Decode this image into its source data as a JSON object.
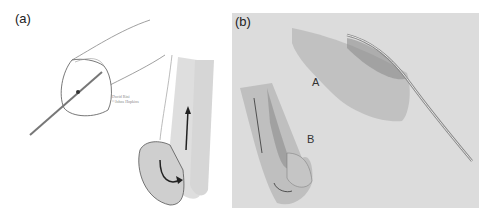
{
  "figure": {
    "panels": [
      {
        "id": "a",
        "label": "(a)",
        "credit_line_1": "David Rini",
        "credit_line_2": "©Johns Hopkins"
      },
      {
        "id": "b",
        "label": "(b)",
        "annotations": [
          "A",
          "B"
        ]
      }
    ],
    "colors": {
      "background": "#ffffff",
      "panel_b_background": "#dcdcdc",
      "line": "#555555",
      "stipple": "#9a9a9a",
      "tissue_b": "#b8b8b8"
    }
  }
}
